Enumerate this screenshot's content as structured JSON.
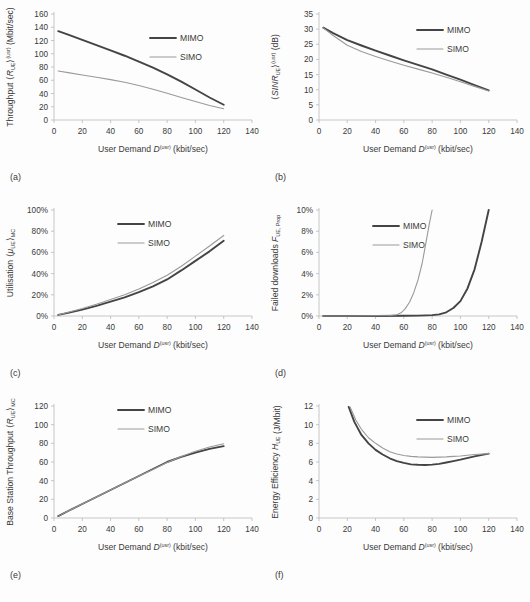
{
  "figure": {
    "background": "#fdfdfd",
    "series_colors": {
      "MIMO": "#444444",
      "SIMO": "#9a9a9a"
    },
    "legend_entries": [
      "MIMO",
      "SIMO"
    ],
    "shared_xlabel_parts": {
      "main": "User Demand ",
      "symbol": "D",
      "sup": "(usr)",
      "units": " (kbit/sec)"
    }
  },
  "panels": [
    {
      "letter": "(a)",
      "ylabel_parts": {
        "main": "Throughput ",
        "open": "⟨",
        "symbol": "R",
        "sub": "UE",
        "close": "⟩",
        "sup": "(usr)",
        "units": " (Mbit/sec)"
      },
      "chart_data": {
        "type": "line",
        "title": "",
        "xlabel": "User Demand D^(usr) (kbit/sec)",
        "ylabel": "Throughput <R_UE>^(usr) (Mbit/sec)",
        "xlim": [
          0,
          140
        ],
        "ylim": [
          0,
          160
        ],
        "xticks": [
          0,
          20,
          40,
          60,
          80,
          100,
          120,
          140
        ],
        "yticks": [
          0,
          20,
          40,
          60,
          80,
          100,
          120,
          140,
          160
        ],
        "grid": false,
        "legend_position": "upper-right-inside",
        "series": [
          {
            "name": "MIMO",
            "x": [
              3,
              10,
              20,
              30,
              40,
              50,
              60,
              70,
              80,
              90,
              100,
              110,
              120
            ],
            "values": [
              134,
              129,
              121,
              113,
              105,
              97,
              88,
              79,
              69,
              58,
              46,
              34,
              23
            ]
          },
          {
            "name": "SIMO",
            "x": [
              3,
              10,
              20,
              30,
              40,
              50,
              60,
              70,
              80,
              90,
              100,
              110,
              120
            ],
            "values": [
              74,
              71.5,
              68,
              64.5,
              61,
              57,
              52,
              46.5,
              40.5,
              34,
              28,
              22,
              17
            ]
          }
        ]
      }
    },
    {
      "letter": "(b)",
      "ylabel_parts": {
        "main": "",
        "open": "⟨",
        "symbol": "SINR",
        "sub": "UE",
        "close": "⟩",
        "sup": "(usr)",
        "units": " (dB)"
      },
      "chart_data": {
        "type": "line",
        "title": "",
        "xlabel": "User Demand D^(usr) (kbit/sec)",
        "ylabel": "<SINR_UE>^(usr) (dB)",
        "xlim": [
          0,
          140
        ],
        "ylim": [
          0,
          35
        ],
        "xticks": [
          0,
          20,
          40,
          60,
          80,
          100,
          120,
          140
        ],
        "yticks": [
          0,
          5,
          10,
          15,
          20,
          25,
          30,
          35
        ],
        "grid": false,
        "legend_position": "upper-right-inside",
        "series": [
          {
            "name": "MIMO",
            "x": [
              3,
              10,
              20,
              30,
              40,
              50,
              60,
              70,
              80,
              90,
              100,
              110,
              120
            ],
            "values": [
              30.5,
              28.7,
              26.4,
              24.6,
              22.9,
              21.3,
              19.7,
              18.2,
              16.7,
              15.0,
              13.3,
              11.5,
              9.8
            ]
          },
          {
            "name": "SIMO",
            "x": [
              3,
              10,
              20,
              30,
              40,
              50,
              60,
              70,
              80,
              90,
              100,
              110,
              120
            ],
            "values": [
              30.4,
              27.9,
              24.7,
              22.6,
              21.0,
              19.5,
              18.1,
              16.8,
              15.5,
              14.1,
              12.6,
              11.1,
              9.6
            ]
          }
        ]
      }
    },
    {
      "letter": "(c)",
      "ylabel_parts": {
        "main": "Utilisation ",
        "open": "⟨",
        "symbol": "μ",
        "sub": "UE",
        "close": "⟩",
        "sup2": "MC",
        "units": ""
      },
      "chart_data": {
        "type": "line",
        "title": "",
        "xlabel": "User Demand D^(usr) (kbit/sec)",
        "ylabel": "Utilisation <mu_UE>_MC",
        "xlim": [
          0,
          140
        ],
        "ylim": [
          0,
          100
        ],
        "xticks": [
          0,
          20,
          40,
          60,
          80,
          100,
          120,
          140
        ],
        "yticks": [
          0,
          20,
          40,
          60,
          80,
          100
        ],
        "ytick_labels": [
          "0%",
          "20%",
          "40%",
          "60%",
          "80%",
          "100%"
        ],
        "grid": false,
        "legend_position": "upper-center-inside",
        "series": [
          {
            "name": "MIMO",
            "x": [
              3,
              10,
              20,
              30,
              40,
              50,
              60,
              70,
              80,
              90,
              100,
              110,
              120
            ],
            "values": [
              1,
              3,
              6,
              9.5,
              13.5,
              17.5,
              22.5,
              28,
              34.5,
              43,
              52,
              61,
              71
            ]
          },
          {
            "name": "SIMO",
            "x": [
              3,
              10,
              20,
              30,
              40,
              50,
              60,
              70,
              80,
              90,
              100,
              110,
              120
            ],
            "values": [
              1,
              3.5,
              7,
              11,
              15.5,
              20,
              25.5,
              31.5,
              38.5,
              47,
              56.5,
              66,
              76
            ]
          }
        ]
      }
    },
    {
      "letter": "(d)",
      "ylabel_parts": {
        "main": "Failed downloads ",
        "symbol": "F",
        "sub": "UE, Prop",
        "units": ""
      },
      "chart_data": {
        "type": "line",
        "title": "",
        "xlabel": "User Demand D^(usr) (kbit/sec)",
        "ylabel": "Failed downloads F_UE,Prop",
        "xlim": [
          0,
          140
        ],
        "ylim": [
          0,
          10
        ],
        "xticks": [
          0,
          20,
          40,
          60,
          80,
          100,
          120,
          140
        ],
        "yticks": [
          0,
          2,
          4,
          6,
          8,
          10
        ],
        "ytick_labels": [
          "0%",
          "2%",
          "4%",
          "6%",
          "8%",
          "10%"
        ],
        "grid": false,
        "legend_position": "upper-center-inside",
        "series": [
          {
            "name": "MIMO",
            "x": [
              3,
              20,
              40,
              60,
              70,
              80,
              85,
              90,
              95,
              100,
              105,
              110,
              115,
              120
            ],
            "values": [
              0,
              0,
              0,
              0.02,
              0.04,
              0.08,
              0.15,
              0.35,
              0.75,
              1.4,
              2.6,
              4.4,
              7.0,
              10.0
            ]
          },
          {
            "name": "SIMO",
            "x": [
              3,
              20,
              40,
              50,
              55,
              58,
              61,
              64,
              67,
              70,
              73,
              76,
              78,
              80
            ],
            "values": [
              0,
              0,
              0.02,
              0.05,
              0.12,
              0.3,
              0.7,
              1.3,
              2.2,
              3.4,
              5.0,
              7.2,
              8.7,
              10.0
            ]
          }
        ]
      }
    },
    {
      "letter": "(e)",
      "ylabel_parts": {
        "main": "Base Station Throughput ",
        "open": "⟨",
        "symbol": "R",
        "sub": "UE",
        "close": "⟩",
        "sup2": "MC",
        "units": ""
      },
      "chart_data": {
        "type": "line",
        "title": "",
        "xlabel": "User Demand D^(usr) (kbit/sec)",
        "ylabel": "Base Station Throughput <R_UE>_MC",
        "xlim": [
          0,
          140
        ],
        "ylim": [
          0,
          120
        ],
        "xticks": [
          0,
          20,
          40,
          60,
          80,
          100,
          120,
          140
        ],
        "yticks": [
          0,
          20,
          40,
          60,
          80,
          100,
          120
        ],
        "grid": false,
        "legend_position": "upper-center-inside",
        "series": [
          {
            "name": "MIMO",
            "x": [
              3,
              10,
              20,
              30,
              40,
              50,
              60,
              70,
              80,
              90,
              100,
              110,
              120
            ],
            "values": [
              2,
              7.5,
              15,
              22.5,
              30,
              37.5,
              45,
              52.5,
              60,
              65.5,
              70,
              74,
              77
            ]
          },
          {
            "name": "SIMO",
            "x": [
              3,
              10,
              20,
              30,
              40,
              50,
              60,
              70,
              80,
              90,
              100,
              110,
              120
            ],
            "values": [
              2,
              7.5,
              15,
              22.5,
              30,
              37.5,
              45,
              52,
              59.5,
              66,
              71.5,
              76,
              79.5
            ]
          }
        ]
      }
    },
    {
      "letter": "(f)",
      "ylabel_parts": {
        "main": "Energy Efficiency ",
        "symbol": "H",
        "sub": "UE",
        "units": " (J/Mbit)"
      },
      "chart_data": {
        "type": "line",
        "title": "",
        "xlabel": "User Demand D^(usr) (kbit/sec)",
        "ylabel": "Energy Efficiency H_UE (J/Mbit)",
        "xlim": [
          0,
          140
        ],
        "ylim": [
          0,
          12
        ],
        "xticks": [
          0,
          20,
          40,
          60,
          80,
          100,
          120,
          140
        ],
        "yticks": [
          0,
          2,
          4,
          6,
          8,
          10,
          12
        ],
        "grid": false,
        "legend_position": "upper-right-inside",
        "series": [
          {
            "name": "MIMO",
            "x": [
              21,
              25,
              30,
              35,
              40,
              45,
              50,
              55,
              60,
              65,
              70,
              75,
              80,
              85,
              90,
              95,
              100,
              110,
              120
            ],
            "values": [
              11.9,
              10.3,
              8.9,
              8.0,
              7.3,
              6.8,
              6.4,
              6.1,
              5.9,
              5.75,
              5.7,
              5.68,
              5.72,
              5.8,
              5.95,
              6.1,
              6.25,
              6.6,
              6.9
            ]
          },
          {
            "name": "SIMO",
            "x": [
              22,
              26,
              30,
              35,
              40,
              45,
              50,
              55,
              60,
              65,
              70,
              75,
              80,
              85,
              90,
              95,
              100,
              110,
              120
            ],
            "values": [
              11.9,
              10.5,
              9.5,
              8.6,
              8.0,
              7.5,
              7.1,
              6.85,
              6.7,
              6.6,
              6.55,
              6.52,
              6.5,
              6.52,
              6.55,
              6.6,
              6.65,
              6.8,
              6.9
            ]
          }
        ]
      }
    }
  ]
}
